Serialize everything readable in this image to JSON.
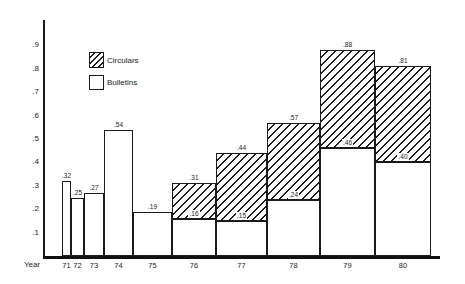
{
  "chart_data": {
    "type": "bar",
    "stacked": true,
    "title": "",
    "xlabel": "Year",
    "ylabel": "",
    "ylim": [
      0,
      1.0
    ],
    "grid": false,
    "legend_position": "upper-left-inside",
    "categories": [
      "71",
      "72",
      "73",
      "74",
      "75",
      "76",
      "77",
      "78",
      "79",
      "80"
    ],
    "series": [
      {
        "name": "Bulletins",
        "style": "open-white",
        "values": [
          0.32,
          0.25,
          0.27,
          0.54,
          0.19,
          0.16,
          0.15,
          0.24,
          0.46,
          0.4
        ]
      },
      {
        "name": "Circulars",
        "style": "diagonal-hatch",
        "values": [
          0,
          0,
          0,
          0,
          0,
          0.15,
          0.29,
          0.33,
          0.42,
          0.41
        ]
      }
    ],
    "totals": [
      0.32,
      0.25,
      0.27,
      0.54,
      0.19,
      0.31,
      0.44,
      0.57,
      0.88,
      0.81
    ],
    "total_labels": [
      ".32",
      ".25",
      ".27",
      ".54",
      ".19",
      ".31",
      ".44",
      ".57",
      ".88",
      ".81"
    ],
    "inner_labels": [
      "",
      "",
      "",
      "",
      "",
      ".16",
      ".15",
      ".24",
      ".46",
      ".40"
    ],
    "yticks": [
      {
        "value": 0.9,
        "label": ".9"
      },
      {
        "value": 0.8,
        "label": ".8"
      },
      {
        "value": 0.7,
        "label": ".7"
      },
      {
        "value": 0.6,
        "label": ".6"
      },
      {
        "value": 0.5,
        "label": ".5"
      },
      {
        "value": 0.4,
        "label": ".4"
      },
      {
        "value": 0.3,
        "label": ".3"
      },
      {
        "value": 0.2,
        "label": ".2"
      },
      {
        "value": 0.1,
        "label": ".1"
      }
    ],
    "geometry": {
      "axis_x_px": 43,
      "axis_top_px": 20,
      "baseline_y_px": 256,
      "baseline_right_px": 440,
      "px_per_unit": 234,
      "bar_edges_px": [
        62,
        71,
        84,
        104,
        133,
        172,
        216,
        267,
        320,
        375,
        431
      ]
    }
  },
  "axis": {
    "x_title": "Year"
  },
  "legend": {
    "items": [
      {
        "label": "Circulars",
        "swatch": "hatched-box"
      },
      {
        "label": "Bulletins",
        "swatch": "open-box"
      }
    ]
  },
  "colors": {
    "ink": "#1a1a1a",
    "background": "#ffffff"
  }
}
